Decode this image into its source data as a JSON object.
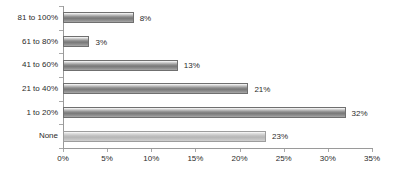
{
  "chart_data": {
    "type": "bar",
    "orientation": "horizontal",
    "title": "",
    "subtitle": "",
    "xlabel": "",
    "ylabel": "",
    "xlim": [
      0,
      35
    ],
    "xtick_labels": [
      "0%",
      "5%",
      "10%",
      "15%",
      "20%",
      "25%",
      "30%",
      "35%"
    ],
    "xticks": [
      0,
      5,
      10,
      15,
      20,
      25,
      30,
      35
    ],
    "grid": false,
    "legend": "none",
    "categories": [
      "None",
      "1 to 20%",
      "21 to 40%",
      "41 to 60%",
      "61 to 80%",
      "81 to 100%"
    ],
    "values": [
      23,
      32,
      21,
      13,
      3,
      8
    ],
    "data_labels": [
      "23%",
      "32%",
      "21%",
      "13%",
      "3%",
      "8%"
    ],
    "bars": [
      {
        "category": "81 to 100%",
        "value": 8,
        "label": "8%",
        "style": "dark"
      },
      {
        "category": "61 to 80%",
        "value": 3,
        "label": "3%",
        "style": "dark"
      },
      {
        "category": "41 to 60%",
        "value": 13,
        "label": "13%",
        "style": "dark"
      },
      {
        "category": "21 to 40%",
        "value": 21,
        "label": "21%",
        "style": "dark"
      },
      {
        "category": "1 to 20%",
        "value": 32,
        "label": "32%",
        "style": "dark"
      },
      {
        "category": "None",
        "value": 23,
        "label": "23%",
        "style": "light"
      }
    ],
    "colors": {
      "bar_dark": "#787878",
      "bar_light": "#b6b6b6",
      "axis": "#9a9a9a",
      "text": "#2b2b2b",
      "background": "#ffffff"
    }
  }
}
